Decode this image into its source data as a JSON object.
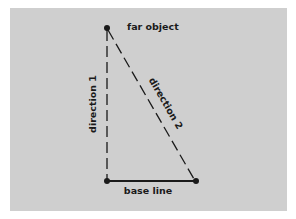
{
  "diagram": {
    "type": "triangulation",
    "colors": {
      "page_background": "#ffffff",
      "panel_background": "#cfcfcf",
      "ink": "#1a1a1a"
    },
    "points": {
      "far_object": {
        "x": 107,
        "y": 28
      },
      "base_left": {
        "x": 107,
        "y": 181
      },
      "base_right": {
        "x": 196,
        "y": 181
      }
    },
    "labels": {
      "far_object": "far object",
      "direction_1": "direction 1",
      "direction_2": "direction 2",
      "base_line": "base line"
    },
    "lines": [
      {
        "name": "direction 1",
        "from": "base_left",
        "to": "far_object",
        "style": "dashed"
      },
      {
        "name": "direction 2",
        "from": "base_right",
        "to": "far_object",
        "style": "dashed"
      },
      {
        "name": "base line",
        "from": "base_left",
        "to": "base_right",
        "style": "solid"
      }
    ]
  }
}
